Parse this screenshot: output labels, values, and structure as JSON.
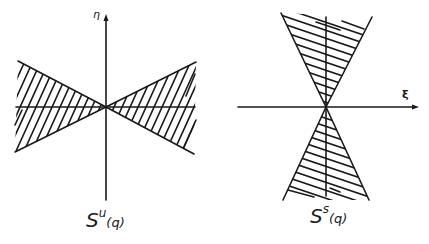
{
  "figure": {
    "stroke_color": "#1a1a1a",
    "background": "#ffffff",
    "left_panel": {
      "axis_label_vertical": "η",
      "caption_main": "S",
      "caption_sup": "u",
      "caption_arg": "(q)",
      "description": "Horizontal double cone (unstable cone) hatched with slanted lines",
      "hatch_direction": "steep diagonal"
    },
    "right_panel": {
      "axis_label_horizontal": "ξ",
      "caption_main": "S",
      "caption_sup": "s",
      "caption_arg": "(q)",
      "description": "Vertical double cone (stable cone) hatched with slanted lines",
      "hatch_direction": "shallow diagonal"
    }
  }
}
